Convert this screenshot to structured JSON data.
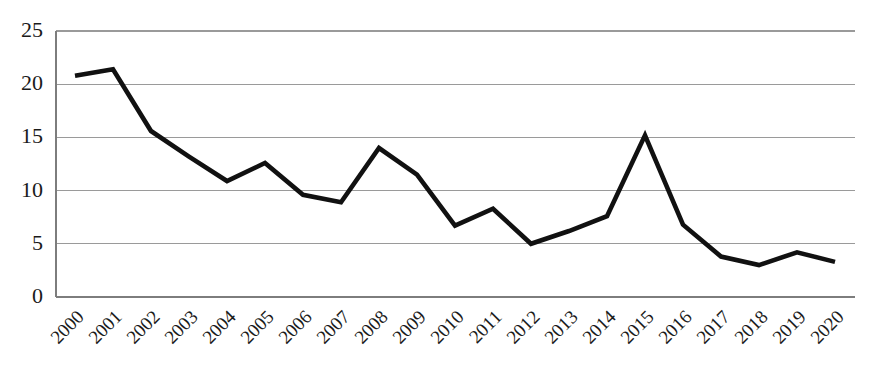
{
  "chart_data": {
    "type": "line",
    "title": "",
    "subtitle": "",
    "xlabel": "",
    "ylabel": "",
    "categories": [
      "2000",
      "2001",
      "2002",
      "2003",
      "2004",
      "2005",
      "2006",
      "2007",
      "2008",
      "2009",
      "2010",
      "2011",
      "2012",
      "2013",
      "2014",
      "2015",
      "2016",
      "2017",
      "2018",
      "2019",
      "2020"
    ],
    "values": [
      20.8,
      21.4,
      15.6,
      13.2,
      10.9,
      12.6,
      9.6,
      8.9,
      14.0,
      11.5,
      6.7,
      8.3,
      5.0,
      6.2,
      7.6,
      15.2,
      6.8,
      3.8,
      3.0,
      4.2,
      3.3
    ],
    "series": [
      {
        "name": "series-1",
        "values": [
          20.8,
          21.4,
          15.6,
          13.2,
          10.9,
          12.6,
          9.6,
          8.9,
          14.0,
          11.5,
          6.7,
          8.3,
          5.0,
          6.2,
          7.6,
          15.2,
          6.8,
          3.8,
          3.0,
          4.2,
          3.3
        ],
        "color": "#111111"
      }
    ],
    "ylim": [
      0,
      25
    ],
    "yticks": [
      0,
      5,
      10,
      15,
      20,
      25
    ],
    "ytick_labels": [
      "0",
      "5",
      "10",
      "15",
      "20",
      "25"
    ],
    "xtick_labels": [
      "2000",
      "2001",
      "2002",
      "2003",
      "2004",
      "2005",
      "2006",
      "2007",
      "2008",
      "2009",
      "2010",
      "2011",
      "2012",
      "2013",
      "2014",
      "2015",
      "2016",
      "2017",
      "2018",
      "2019",
      "2020"
    ],
    "xtick_rotation_deg": 45,
    "grid": {
      "horizontal": true,
      "vertical": false,
      "color": "#9a9a9a"
    },
    "legend": {
      "visible": false,
      "position": "none",
      "entries": []
    },
    "annotations": [],
    "colors": {
      "line": "#111111",
      "grid": "#9a9a9a",
      "axis": "#7d7d7d",
      "text": "#1a1a1a",
      "background": "#ffffff"
    }
  }
}
